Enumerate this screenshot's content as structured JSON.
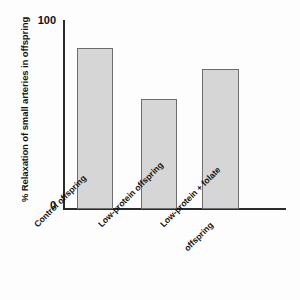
{
  "chart_data": {
    "type": "bar",
    "title": "",
    "xlabel": "",
    "ylabel": "%  Relaxation of small arteries in offspring",
    "ylim": [
      0,
      100
    ],
    "grid": false,
    "legend": false,
    "categories": [
      "Control offspring",
      "Low-protein offspring",
      "Low-protein + folate offspring"
    ],
    "category_lines": [
      [
        "Control offspring"
      ],
      [
        "Low-protein offspring"
      ],
      [
        "Low-protein + folate",
        "offspring"
      ]
    ],
    "values": [
      85,
      58,
      74
    ],
    "y_ticks": [
      "0",
      "100"
    ],
    "bar_fill_color": "#d6d6d6",
    "bar_edge_color": "#6d6d6d",
    "axis_color": "#2b2b2b",
    "background_color": "#ffffff"
  }
}
